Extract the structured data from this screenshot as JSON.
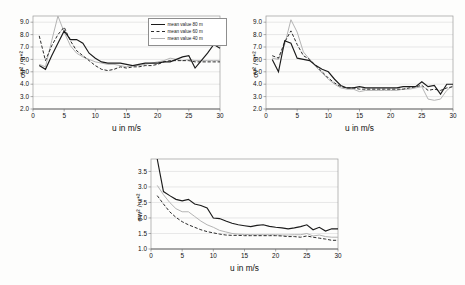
{
  "figure": {
    "background": "#fdfdfc",
    "legend_position": "top-right of first panel",
    "series_colors": {
      "m80": "#1b1b1b",
      "m60": "#2b2b2b",
      "m40": "#b4b4b4"
    }
  },
  "legend": {
    "items": [
      {
        "key": "m80",
        "label": "mean value 80 m",
        "style": "solid"
      },
      {
        "key": "m60",
        "label": "mean value 60 m",
        "style": "dashed"
      },
      {
        "key": "m40",
        "label": "mean value 40 m",
        "style": "solid-light"
      }
    ]
  },
  "chart_data": [
    {
      "id": "panel-u",
      "type": "line",
      "title": "",
      "xlabel": "u in m/s",
      "ylabel": "σu² / u*²",
      "xlim": [
        0,
        30
      ],
      "ylim": [
        2.0,
        9.5
      ],
      "xticks": [
        0,
        5,
        10,
        15,
        20,
        25,
        30
      ],
      "yticks": [
        2.0,
        3.0,
        4.0,
        5.0,
        6.0,
        7.0,
        8.0,
        9.0
      ],
      "ytick_labels": [
        "2.0",
        "3.0",
        "4.0",
        "5.0",
        "6.0",
        "7.0",
        "8.0",
        "9.0"
      ],
      "xtick_labels": [
        "0",
        "5",
        "10",
        "15",
        "20",
        "25",
        "30"
      ],
      "grid": true,
      "legend": true,
      "x": [
        1,
        2,
        3,
        4,
        5,
        6,
        7,
        8,
        9,
        10,
        11,
        12,
        13,
        14,
        15,
        16,
        17,
        18,
        19,
        20,
        21,
        22,
        23,
        24,
        25,
        26,
        27,
        28,
        29,
        30
      ],
      "series": [
        {
          "name": "mean value 80 m",
          "key": "m80",
          "values": [
            5.5,
            5.2,
            6.3,
            7.3,
            8.3,
            7.6,
            7.6,
            7.3,
            6.5,
            6.1,
            5.8,
            5.7,
            5.7,
            5.7,
            5.6,
            5.5,
            5.6,
            5.7,
            5.7,
            5.7,
            5.8,
            5.8,
            6.0,
            6.2,
            6.3,
            5.3,
            5.9,
            6.5,
            7.2,
            6.9
          ]
        },
        {
          "name": "mean value 60 m",
          "key": "m60",
          "values": [
            7.9,
            5.9,
            7.1,
            8.0,
            8.6,
            7.5,
            6.7,
            6.3,
            5.9,
            5.5,
            5.2,
            5.1,
            5.2,
            5.4,
            5.3,
            5.4,
            5.4,
            5.5,
            5.5,
            5.6,
            5.8,
            5.9,
            5.9,
            5.9,
            5.9,
            5.8,
            5.8,
            5.8,
            5.8,
            5.8
          ]
        },
        {
          "name": "mean value 40 m",
          "key": "m40",
          "values": [
            5.6,
            5.4,
            7.5,
            9.5,
            8.2,
            7.1,
            6.5,
            6.2,
            6.0,
            5.8,
            5.7,
            5.6,
            5.6,
            5.5,
            5.4,
            5.5,
            5.5,
            5.6,
            5.7,
            5.8,
            5.9,
            6.1,
            6.0,
            5.9,
            6.0,
            5.9,
            5.9,
            5.9,
            5.9,
            5.9
          ]
        }
      ]
    },
    {
      "id": "panel-v",
      "type": "line",
      "title": "",
      "xlabel": "u in m/s",
      "ylabel": "σv² / u*²",
      "xlim": [
        0,
        30
      ],
      "ylim": [
        2.0,
        9.5
      ],
      "xticks": [
        0,
        5,
        10,
        15,
        20,
        25,
        30
      ],
      "yticks": [
        2.0,
        3.0,
        4.0,
        5.0,
        6.0,
        7.0,
        8.0,
        9.0
      ],
      "ytick_labels": [
        "2.0",
        "3.0",
        "4.0",
        "5.0",
        "6.0",
        "7.0",
        "8.0",
        "9.0"
      ],
      "xtick_labels": [
        "0",
        "5",
        "10",
        "15",
        "20",
        "25",
        "30"
      ],
      "grid": true,
      "legend": false,
      "x": [
        1,
        2,
        3,
        4,
        5,
        6,
        7,
        8,
        9,
        10,
        11,
        12,
        13,
        14,
        15,
        16,
        17,
        18,
        19,
        20,
        21,
        22,
        23,
        24,
        25,
        26,
        27,
        28,
        29,
        30
      ],
      "series": [
        {
          "name": "mean value 80 m",
          "key": "m80",
          "values": [
            6.0,
            5.0,
            7.5,
            7.3,
            6.1,
            6.0,
            5.9,
            5.5,
            5.2,
            5.0,
            4.4,
            3.9,
            3.7,
            3.7,
            3.8,
            3.7,
            3.7,
            3.7,
            3.7,
            3.7,
            3.7,
            3.8,
            3.8,
            3.8,
            4.2,
            3.8,
            3.9,
            3.2,
            4.0,
            4.0
          ]
        },
        {
          "name": "mean value 60 m",
          "key": "m60",
          "values": [
            6.3,
            6.1,
            7.4,
            8.3,
            7.2,
            6.3,
            6.0,
            5.5,
            5.0,
            4.5,
            4.1,
            3.8,
            3.7,
            3.7,
            3.6,
            3.6,
            3.6,
            3.6,
            3.6,
            3.6,
            3.6,
            3.6,
            3.7,
            3.8,
            3.9,
            3.5,
            3.6,
            3.5,
            3.7,
            3.8
          ]
        },
        {
          "name": "mean value 40 m",
          "key": "m40",
          "values": [
            6.1,
            6.0,
            7.2,
            9.2,
            8.2,
            6.6,
            6.0,
            5.4,
            4.9,
            4.4,
            4.0,
            3.7,
            3.6,
            3.6,
            3.4,
            3.5,
            3.5,
            3.5,
            3.5,
            3.5,
            3.5,
            3.6,
            3.6,
            3.7,
            3.8,
            2.8,
            2.7,
            2.8,
            3.5,
            3.9
          ]
        }
      ]
    },
    {
      "id": "panel-w",
      "type": "line",
      "title": "",
      "xlabel": "u in m/s",
      "ylabel": "σw² / u*²",
      "xlim": [
        0,
        30
      ],
      "ylim": [
        1.0,
        3.9
      ],
      "xticks": [
        0,
        5,
        10,
        15,
        20,
        25,
        30
      ],
      "yticks": [
        1.0,
        1.5,
        2.0,
        2.5,
        3.0,
        3.5
      ],
      "ytick_labels": [
        "1.0",
        "1.5",
        "2.0",
        "2.5",
        "3.0",
        "3.5"
      ],
      "xtick_labels": [
        "0",
        "5",
        "10",
        "15",
        "20",
        "25",
        "30"
      ],
      "grid": true,
      "legend": false,
      "x": [
        1,
        2,
        3,
        4,
        5,
        6,
        7,
        8,
        9,
        10,
        11,
        12,
        13,
        14,
        15,
        16,
        17,
        18,
        19,
        20,
        21,
        22,
        23,
        24,
        25,
        26,
        27,
        28,
        29,
        30
      ],
      "series": [
        {
          "name": "mean value 80 m",
          "key": "m80",
          "values": [
            3.9,
            2.85,
            2.72,
            2.6,
            2.55,
            2.6,
            2.45,
            2.4,
            2.32,
            2.0,
            1.98,
            1.9,
            1.83,
            1.78,
            1.75,
            1.72,
            1.76,
            1.78,
            1.73,
            1.7,
            1.68,
            1.65,
            1.68,
            1.72,
            1.78,
            1.62,
            1.7,
            1.58,
            1.65,
            1.65
          ]
        },
        {
          "name": "mean value 60 m",
          "key": "m60",
          "values": [
            2.72,
            2.45,
            2.2,
            2.02,
            1.88,
            1.78,
            1.7,
            1.62,
            1.56,
            1.52,
            1.48,
            1.45,
            1.44,
            1.44,
            1.43,
            1.43,
            1.43,
            1.43,
            1.43,
            1.43,
            1.42,
            1.4,
            1.4,
            1.38,
            1.42,
            1.38,
            1.35,
            1.32,
            1.28,
            1.28
          ]
        },
        {
          "name": "mean value 40 m",
          "key": "m40",
          "values": [
            3.05,
            2.75,
            2.5,
            2.3,
            2.2,
            2.2,
            2.05,
            1.9,
            1.78,
            1.7,
            1.6,
            1.55,
            1.5,
            1.48,
            1.47,
            1.46,
            1.46,
            1.46,
            1.46,
            1.46,
            1.45,
            1.45,
            1.46,
            1.46,
            1.5,
            1.42,
            1.45,
            1.4,
            1.38,
            1.38
          ]
        }
      ]
    }
  ]
}
